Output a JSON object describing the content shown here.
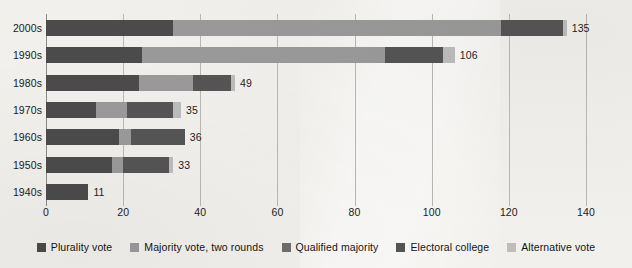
{
  "chart_data": {
    "type": "bar",
    "orientation": "horizontal",
    "stacked": true,
    "title": "",
    "subtitle": "",
    "xlabel": "",
    "ylabel": "",
    "xlim": [
      0,
      140
    ],
    "ylim": null,
    "grid": true,
    "legend_position": "bottom",
    "categories": [
      "2000s",
      "1990s",
      "1980s",
      "1970s",
      "1960s",
      "1950s",
      "1940s"
    ],
    "xticks": [
      0,
      20,
      40,
      60,
      80,
      100,
      120,
      140
    ],
    "xtick_labels": [
      "0",
      "20",
      "40",
      "60",
      "80",
      "100",
      "120",
      "140"
    ],
    "series": [
      {
        "name": "Plurality vote",
        "color": "#4b4b4b",
        "values": [
          33,
          25,
          24,
          13,
          19,
          17,
          11
        ]
      },
      {
        "name": "Majority vote, two rounds",
        "color": "#9a9a9a",
        "values": [
          85,
          63,
          14,
          8,
          3,
          3,
          0
        ]
      },
      {
        "name": "Qualified majority",
        "color": "#6e6e6e",
        "values": [
          0,
          0,
          0,
          0,
          0,
          0,
          0
        ]
      },
      {
        "name": "Electoral college",
        "color": "#555555",
        "values": [
          16,
          15,
          10,
          12,
          14,
          12,
          0
        ]
      },
      {
        "name": "Alternative vote",
        "color": "#bdbdbd",
        "values": [
          1,
          3,
          1,
          2,
          0,
          1,
          0
        ]
      }
    ],
    "totals": [
      135,
      106,
      49,
      35,
      36,
      33,
      11
    ],
    "total_labels": [
      "135",
      "106",
      "49",
      "35",
      "36",
      "33",
      "11"
    ]
  },
  "legend": {
    "items": [
      {
        "label": "Plurality vote",
        "color": "#4b4b4b"
      },
      {
        "label": "Majority vote, two rounds",
        "color": "#9a9a9a"
      },
      {
        "label": "Qualified majority",
        "color": "#6e6e6e"
      },
      {
        "label": "Electoral college",
        "color": "#555555"
      },
      {
        "label": "Alternative vote",
        "color": "#bdbdbd"
      }
    ]
  },
  "style": {
    "background": "#f1f0ec",
    "gridline_color": "#b9b8b3",
    "axis_color": "#8c8b87",
    "text_color": "#1a1a1a"
  }
}
